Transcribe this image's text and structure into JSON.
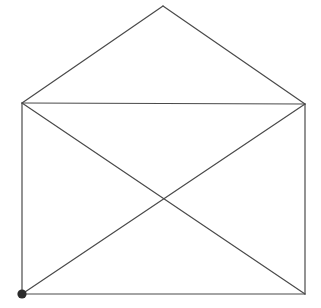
{
  "figure": {
    "canvas": {
      "width": 321,
      "height": 308,
      "background_color": "#ffffff"
    },
    "style": {
      "line_color": "#4a4a4a",
      "line_width": 1.2,
      "marker_color": "#2b2b2b",
      "marker_radius": 4.6
    },
    "vertices": [
      {
        "id": "apex",
        "label": "apex",
        "x": 163,
        "y": 6,
        "marked": false,
        "degree": 2
      },
      {
        "id": "top-left",
        "label": "top-left corner",
        "x": 22,
        "y": 103,
        "marked": false,
        "degree": 4
      },
      {
        "id": "top-right",
        "label": "top-right corner",
        "x": 305,
        "y": 104,
        "marked": false,
        "degree": 4
      },
      {
        "id": "bottom-left",
        "label": "bottom-left corner (start)",
        "x": 22,
        "y": 294,
        "marked": true,
        "degree": 3
      },
      {
        "id": "bottom-right",
        "label": "bottom-right corner",
        "x": 305,
        "y": 294,
        "marked": false,
        "degree": 3
      },
      {
        "id": "crossing",
        "label": "diagonal crossing",
        "x": 163,
        "y": 196,
        "marked": false,
        "degree": 0
      }
    ],
    "edges": [
      {
        "id": "flap-left",
        "name": "flap-left-edge",
        "from": "top-left",
        "to": "apex",
        "x1": 22,
        "y1": 103,
        "x2": 163,
        "y2": 6
      },
      {
        "id": "flap-right",
        "name": "flap-right-edge",
        "from": "apex",
        "to": "top-right",
        "x1": 163,
        "y1": 6,
        "x2": 305,
        "y2": 104
      },
      {
        "id": "top",
        "name": "top-edge",
        "from": "top-left",
        "to": "top-right",
        "x1": 22,
        "y1": 103,
        "x2": 305,
        "y2": 104
      },
      {
        "id": "left",
        "name": "left-edge",
        "from": "top-left",
        "to": "bottom-left",
        "x1": 22,
        "y1": 103,
        "x2": 22,
        "y2": 294
      },
      {
        "id": "right",
        "name": "right-edge",
        "from": "top-right",
        "to": "bottom-right",
        "x1": 305,
        "y1": 104,
        "x2": 305,
        "y2": 294
      },
      {
        "id": "bottom",
        "name": "bottom-edge",
        "from": "bottom-left",
        "to": "bottom-right",
        "x1": 22,
        "y1": 294,
        "x2": 305,
        "y2": 294
      },
      {
        "id": "diagonal-tl-br",
        "name": "diagonal-topleft-bottomright",
        "from": "top-left",
        "to": "bottom-right",
        "x1": 22,
        "y1": 103,
        "x2": 305,
        "y2": 294
      },
      {
        "id": "diagonal-bl-tr",
        "name": "diagonal-bottomleft-topright",
        "from": "bottom-left",
        "to": "top-right",
        "x1": 22,
        "y1": 294,
        "x2": 305,
        "y2": 104
      }
    ]
  }
}
